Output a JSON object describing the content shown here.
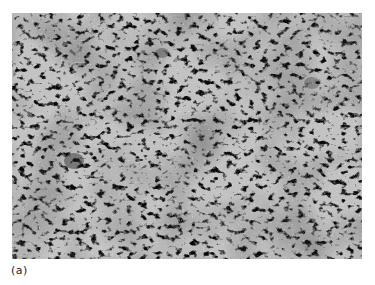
{
  "figure": {
    "panel_label": "(a)",
    "image_description": "grayscale histology micrograph of densely packed spindle/oval cells",
    "colors": {
      "background": "#ffffff",
      "tissue_base": "#bdbdbd",
      "nuclei_dark": "#3a3a3a",
      "label_text": "#222222"
    }
  }
}
